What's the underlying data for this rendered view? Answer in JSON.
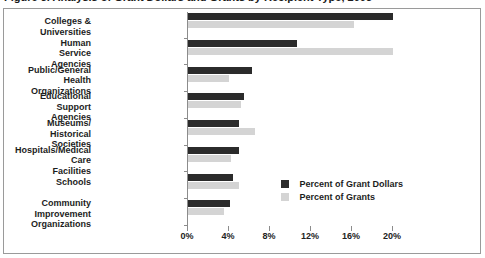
{
  "title": "Figure 3. Analysis of Grant Dollars and Grants by Recipient Type, 2003",
  "legend": {
    "position": "inside-right",
    "entries": [
      {
        "label": "Percent of Grant Dollars",
        "color": "#2b2b2b",
        "swatch": "legend-swatch-dark"
      },
      {
        "label": "Percent of Grants",
        "color": "#d4d4d4",
        "swatch": "legend-swatch-light"
      }
    ]
  },
  "axis": {
    "ticklabels": [
      "0%",
      "4%",
      "8%",
      "12%",
      "16%",
      "20%"
    ],
    "tickvalues": [
      0,
      4,
      8,
      12,
      16,
      20
    ]
  },
  "chart_data": {
    "type": "bar",
    "orientation": "horizontal",
    "title": "Figure 3. Analysis of Grant Dollars and Grants by Recipient Type, 2003",
    "xlabel": "",
    "ylabel": "",
    "xlim": [
      0,
      20
    ],
    "xticks": [
      0,
      4,
      8,
      12,
      16,
      20
    ],
    "xtick_labels": [
      "0%",
      "4%",
      "8%",
      "12%",
      "16%",
      "20%"
    ],
    "grid": false,
    "legend_position": "inside-right",
    "categories": [
      "Colleges & Universities",
      "Human Service\nAgencies",
      "Public/General\nHealth Organizations",
      "Educational Support\nAgencies",
      "Museums/\nHistorical Societies",
      "Hospitals/Medical Care\nFacilities",
      "Schools",
      "Community Improvement\nOrganizations"
    ],
    "series": [
      {
        "name": "Percent of Grant Dollars",
        "color": "#2b2b2b",
        "values": [
          20.0,
          10.6,
          6.2,
          5.5,
          5.0,
          5.0,
          4.4,
          4.1
        ]
      },
      {
        "name": "Percent of Grants",
        "color": "#d4d4d4",
        "values": [
          16.2,
          20.0,
          4.0,
          5.2,
          6.5,
          4.2,
          5.0,
          3.5
        ]
      }
    ]
  }
}
